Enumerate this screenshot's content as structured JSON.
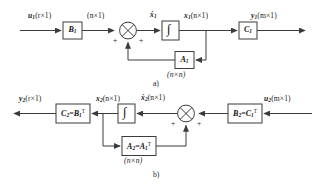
{
  "figure": {
    "title_a": "a)",
    "title_b": "b)",
    "background": "#ffffff",
    "line_color": "#3b3b3b",
    "text_color": "#1a1a1a"
  },
  "diagram_a": {
    "caption": "a)",
    "input_signal": {
      "base": "u",
      "sub": "1",
      "dims": "(r×1)"
    },
    "block_b1": {
      "base": "B",
      "sub": "1"
    },
    "signal_after_b1": {
      "dims": "(n×1)"
    },
    "summing_junction": {
      "sign_left": "+",
      "sign_right": "+",
      "glyph": "circle-x"
    },
    "state_derivative": {
      "base": "ẋ",
      "sub": "1",
      "dims": ""
    },
    "integrator": {
      "glyph": "∫"
    },
    "state_signal": {
      "base": "x",
      "sub": "1",
      "dims": "(n×1)"
    },
    "block_c1": {
      "base": "C",
      "sub": "1"
    },
    "output_signal": {
      "base": "y",
      "sub": "1",
      "dims": "(m×1)"
    },
    "feedback_block_a1": {
      "base": "A",
      "sub": "1"
    },
    "feedback_dims": "(n×n)"
  },
  "diagram_b": {
    "caption": "b)",
    "input_signal": {
      "base": "u",
      "sub": "2",
      "dims": "(m×1)"
    },
    "block_b2": {
      "base": "B",
      "sub": "2",
      "eq": "=",
      "rhs_base": "C",
      "rhs_sub": "1",
      "rhs_sup": "T"
    },
    "summing_junction": {
      "sign_left": "+",
      "sign_right": "+",
      "glyph": "circle-x"
    },
    "state_derivative": {
      "base": "ẋ",
      "sub": "2",
      "dims": "(n×1)"
    },
    "integrator": {
      "glyph": "∫"
    },
    "state_signal": {
      "base": "x",
      "sub": "2",
      "dims": "(n×1)"
    },
    "block_c2": {
      "base": "C",
      "sub": "2",
      "eq": "=",
      "rhs_base": "B",
      "rhs_sub": "1",
      "rhs_sup": "T"
    },
    "output_signal": {
      "base": "y",
      "sub": "2",
      "dims": "(r×1)"
    },
    "feedback_block_a2": {
      "base": "A",
      "sub": "2",
      "eq": "=",
      "rhs_base": "A",
      "rhs_sub": "1",
      "rhs_sup": "T"
    },
    "feedback_dims": "(n×n)"
  }
}
